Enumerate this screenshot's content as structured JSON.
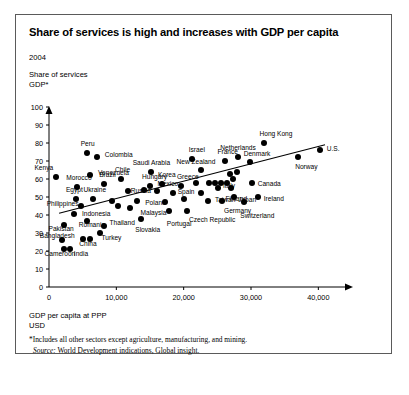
{
  "exhibit": {
    "title": "Share of services is high and increases with GDP per capita",
    "year": "2004",
    "y_axis_caption_line1": "Share of services",
    "y_axis_caption_line2": "GDP*",
    "x_axis_caption_line1": "GDP per capita at PPP",
    "x_axis_caption_line2": "USD",
    "footnote": "*Includes all other sectors except agriculture, manufacturing, and mining.",
    "source_word": "Source:",
    "source_text": " World Development indications, Global insight."
  },
  "chart_data": {
    "type": "scatter",
    "title": "Share of services is high and increases with GDP per capita",
    "subtitle": "2004",
    "xlabel": "GDP per capita at PPP, USD",
    "ylabel": "Share of services GDP*",
    "xlim": [
      0,
      45000
    ],
    "ylim": [
      0,
      100
    ],
    "xticks": [
      0,
      10000,
      20000,
      30000,
      40000
    ],
    "xtick_labels": [
      "0",
      "10,000",
      "20,000",
      "30,000",
      "40,000"
    ],
    "yticks": [
      0,
      10,
      20,
      30,
      40,
      50,
      60,
      70,
      80,
      90,
      100
    ],
    "ytick_labels": [
      "0",
      "10",
      "20",
      "30",
      "40",
      "50",
      "60",
      "70",
      "80",
      "90",
      "100"
    ],
    "grid": false,
    "legend": "none",
    "marker_color": "#000000",
    "trendline": {
      "label": "linear trend",
      "x_start": 1500,
      "y_start": 41,
      "x_end": 41000,
      "y_end": 79
    },
    "points": [
      {
        "name": "Kenya",
        "x": 1100,
        "y": 61,
        "label_dx": -22,
        "label_dy": -10
      },
      {
        "name": "Peru",
        "x": 5600,
        "y": 74.5,
        "label_dx": -6,
        "label_dy": -10
      },
      {
        "name": "Colombia",
        "x": 7100,
        "y": 72,
        "label_dx": 8,
        "label_dy": -3
      },
      {
        "name": "Venezuela",
        "x": 6100,
        "y": 62,
        "label_dx": 8,
        "label_dy": -3
      },
      {
        "name": "Morocco",
        "x": 4200,
        "y": 55.5,
        "label_dx": -11,
        "label_dy": -10
      },
      {
        "name": "Brazil",
        "x": 8200,
        "y": 57,
        "label_dx": -5,
        "label_dy": -10
      },
      {
        "name": "Egypt",
        "x": 4000,
        "y": 49,
        "label_dx": -10,
        "label_dy": -10
      },
      {
        "name": "Ukraine",
        "x": 6600,
        "y": 49,
        "label_dx": -10,
        "label_dy": -10
      },
      {
        "name": "Philippines",
        "x": 4700,
        "y": 45,
        "label_dx": -34,
        "label_dy": -3
      },
      {
        "name": "Indonesia",
        "x": 3700,
        "y": 40.5,
        "label_dx": 8,
        "label_dy": -1
      },
      {
        "name": "Pakistan",
        "x": 2300,
        "y": 34.5,
        "label_dx": -16,
        "label_dy": 3
      },
      {
        "name": "Romania",
        "x": 5600,
        "y": 36.5,
        "label_dx": -8,
        "label_dy": 3
      },
      {
        "name": "Bangladesh",
        "x": 1900,
        "y": 26,
        "label_dx": -22,
        "label_dy": -5
      },
      {
        "name": "China",
        "x": 5100,
        "y": 26.5,
        "label_dx": -4,
        "label_dy": 4
      },
      {
        "name": "China2",
        "x": 6100,
        "y": 26.5,
        "label_dx": 0,
        "label_dy": 0
      },
      {
        "name": "Cameroon",
        "x": 2300,
        "y": 21,
        "label_dx": -20,
        "label_dy": 4
      },
      {
        "name": "India",
        "x": 3100,
        "y": 21,
        "label_dx": 4,
        "label_dy": 4
      },
      {
        "name": "Thailand",
        "x": 8100,
        "y": 34,
        "label_dx": 6,
        "label_dy": -4
      },
      {
        "name": "Turkey",
        "x": 7500,
        "y": 30,
        "label_dx": 2,
        "label_dy": 4
      },
      {
        "name": "Chile",
        "x": 10700,
        "y": 60,
        "label_dx": -6,
        "label_dy": -10
      },
      {
        "name": "Hungary",
        "x": 15000,
        "y": 56,
        "label_dx": -8,
        "label_dy": -10
      },
      {
        "name": "Mexico",
        "x": 16100,
        "y": 53.5,
        "label_dx": 0,
        "label_dy": -8
      },
      {
        "name": "Russia",
        "x": 11700,
        "y": 53.5,
        "label_dx": 3,
        "label_dy": -1
      },
      {
        "name": "Poland",
        "x": 13100,
        "y": 48,
        "label_dx": 8,
        "label_dy": 1
      },
      {
        "name": "Malaysia",
        "x": 12100,
        "y": 44,
        "label_dx": 10,
        "label_dy": 4
      },
      {
        "name": "Slovakia",
        "x": 13700,
        "y": 38,
        "label_dx": -6,
        "label_dy": 10
      },
      {
        "name": "Saudi Arabia",
        "x": 15100,
        "y": 64,
        "label_dx": -18,
        "label_dy": -10
      },
      {
        "name": "Korea",
        "x": 16800,
        "y": 57,
        "label_dx": -4,
        "label_dy": -10
      },
      {
        "name": "Greece",
        "x": 19600,
        "y": 56,
        "label_dx": -4,
        "label_dy": -10
      },
      {
        "name": "Israel",
        "x": 21200,
        "y": 71,
        "label_dx": -3,
        "label_dy": -10
      },
      {
        "name": "New Zealand",
        "x": 22500,
        "y": 65,
        "label_dx": -24,
        "label_dy": -9
      },
      {
        "name": "Spain",
        "x": 20000,
        "y": 49,
        "label_dx": -6,
        "label_dy": -8
      },
      {
        "name": "Portugal",
        "x": 17800,
        "y": 42,
        "label_dx": -2,
        "label_dy": 12
      },
      {
        "name": "Czech Republic",
        "x": 20500,
        "y": 42,
        "label_dx": 2,
        "label_dy": 8
      },
      {
        "name": "Taiwan",
        "x": 23600,
        "y": 48,
        "label_dx": 7,
        "label_dy": -2
      },
      {
        "name": "Italy",
        "x": 25100,
        "y": 55,
        "label_dx": 5,
        "label_dy": -3
      },
      {
        "name": "France",
        "x": 26200,
        "y": 70,
        "label_dx": -8,
        "label_dy": -10
      },
      {
        "name": "Germany",
        "x": 25700,
        "y": 48,
        "label_dx": 2,
        "label_dy": 9
      },
      {
        "name": "Finland",
        "x": 27100,
        "y": 55,
        "label_dx": -6,
        "label_dy": 10
      },
      {
        "name": "Netherlands",
        "x": 28100,
        "y": 72,
        "label_dx": -18,
        "label_dy": -10
      },
      {
        "name": "Denmark",
        "x": 29800,
        "y": 69.5,
        "label_dx": -6,
        "label_dy": -9
      },
      {
        "name": "Japan",
        "x": 27500,
        "y": 50,
        "label_dx": 4,
        "label_dy": 2
      },
      {
        "name": "Switzerland",
        "x": 29000,
        "y": 47,
        "label_dx": -4,
        "label_dy": 13
      },
      {
        "name": "Ireland",
        "x": 31000,
        "y": 50,
        "label_dx": 6,
        "label_dy": 1
      },
      {
        "name": "Canada",
        "x": 30100,
        "y": 58,
        "label_dx": 6,
        "label_dy": 0
      },
      {
        "name": "Hong Kong",
        "x": 32000,
        "y": 80,
        "label_dx": -5,
        "label_dy": -10
      },
      {
        "name": "Norway",
        "x": 37000,
        "y": 72,
        "label_dx": -3,
        "label_dy": 9
      },
      {
        "name": "U.S.",
        "x": 40200,
        "y": 76,
        "label_dx": 7,
        "label_dy": -2
      }
    ],
    "extra_points": [
      {
        "x": 23800,
        "y": 58
      },
      {
        "x": 24600,
        "y": 58
      },
      {
        "x": 25500,
        "y": 58
      },
      {
        "x": 26400,
        "y": 58
      },
      {
        "x": 27300,
        "y": 60
      },
      {
        "x": 26900,
        "y": 63
      },
      {
        "x": 27900,
        "y": 64
      },
      {
        "x": 21900,
        "y": 58
      },
      {
        "x": 22600,
        "y": 52
      },
      {
        "x": 18400,
        "y": 52
      },
      {
        "x": 17200,
        "y": 47
      },
      {
        "x": 14100,
        "y": 54
      },
      {
        "x": 9300,
        "y": 48
      },
      {
        "x": 10200,
        "y": 45
      }
    ]
  }
}
